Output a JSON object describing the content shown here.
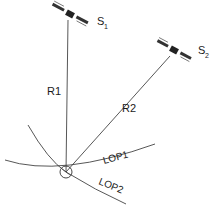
{
  "diagram": {
    "satellites": [
      {
        "label": "S",
        "subscript": "1"
      },
      {
        "label": "S",
        "subscript": "2"
      }
    ],
    "ranges": [
      {
        "label": "R1"
      },
      {
        "label": "R2"
      }
    ],
    "lines_of_position": [
      {
        "label": "LOP1"
      },
      {
        "label": "LOP2"
      }
    ]
  }
}
